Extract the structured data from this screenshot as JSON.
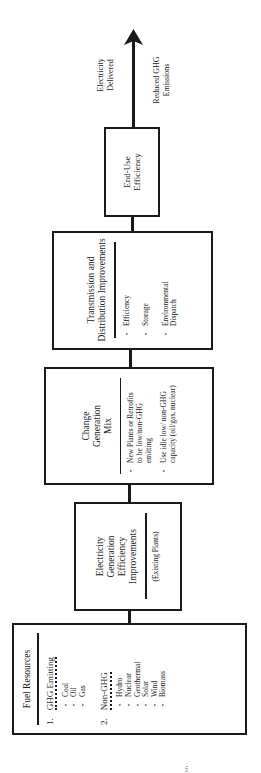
{
  "diagram": {
    "boxes": [
      {
        "title": "Fuel Resources",
        "groups": [
          {
            "number": "1.",
            "heading": "GHG Emitting",
            "items": [
              "Coal",
              "Oil",
              "Gas"
            ]
          },
          {
            "number": "2.",
            "heading": "Non-GHG",
            "items": [
              "Hydro",
              "Nuclear",
              "Geothermal",
              "Solar",
              "Wind",
              "Biomass"
            ]
          }
        ]
      },
      {
        "title": "Electricity Generation Efficiency Improvements",
        "note": "(Existing Plants)"
      },
      {
        "title": "Change Generation Mix",
        "items": [
          "New Plants or Retrofits to be low/non-GHG emitting",
          "Use idle low/ non-GHG capacity (oil/gas, nuclear)"
        ]
      },
      {
        "title": "Transmission and Distribution Improvements",
        "items": [
          "Efficiency",
          "Storage",
          "Environmental Dispatch"
        ]
      },
      {
        "title": "End-Use Efficiency"
      }
    ],
    "arrow_labels": {
      "left": "Electricity Delivered",
      "right": "Reduced GHG Emissions"
    }
  },
  "page_number": "10"
}
